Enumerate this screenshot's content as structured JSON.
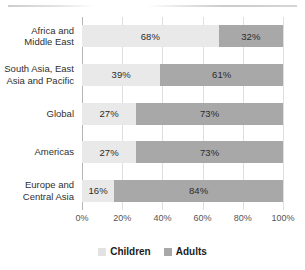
{
  "chart_data": {
    "type": "bar",
    "orientation": "horizontal",
    "stacked": "100%",
    "title": "",
    "xlabel": "",
    "ylabel": "",
    "xlim": [
      0,
      100
    ],
    "grid": true,
    "legend_position": "bottom",
    "categories": [
      "Africa and Middle East",
      "South Asia, East Asia and Pacific",
      "Global",
      "Americas",
      "Europe and Central Asia"
    ],
    "category_lines": [
      [
        "Africa and",
        "Middle East"
      ],
      [
        "South Asia, East",
        "Asia and Pacific"
      ],
      [
        "Global"
      ],
      [
        "Americas"
      ],
      [
        "Europe and",
        "Central Asia"
      ]
    ],
    "series": [
      {
        "name": "Children",
        "color": "#e9e9e9",
        "values": [
          68,
          39,
          27,
          27,
          16
        ],
        "labels": [
          "68%",
          "39%",
          "27%",
          "27%",
          "16%"
        ]
      },
      {
        "name": "Adults",
        "color": "#a8a8a8",
        "values": [
          32,
          61,
          73,
          73,
          84
        ],
        "labels": [
          "32%",
          "61%",
          "73%",
          "73%",
          "84%"
        ]
      }
    ],
    "xticks": [
      0,
      20,
      40,
      60,
      80,
      100
    ],
    "xtick_labels": [
      "0%",
      "20%",
      "40%",
      "60%",
      "80%",
      "100%"
    ]
  },
  "legend": {
    "items": [
      {
        "label": "Children",
        "swatch": "children"
      },
      {
        "label": "Adults",
        "swatch": "adults"
      }
    ]
  }
}
